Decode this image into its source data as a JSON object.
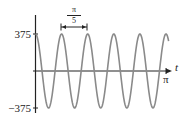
{
  "chart_data": {
    "type": "line",
    "title": "",
    "xlabel": "t",
    "ylabel": "",
    "function": "375*cos(10t)",
    "x_range": [
      0,
      3.14159
    ],
    "ylim": [
      -375,
      375
    ],
    "x_ticks": [
      {
        "value": 3.14159,
        "label": "π"
      }
    ],
    "y_ticks": [
      {
        "value": 375,
        "label": "375"
      },
      {
        "value": -375,
        "label": "−375"
      }
    ],
    "annotations": [
      {
        "type": "period-bracket",
        "label_num": "π",
        "label_den": "5",
        "label": "π/5",
        "from_x": 0.628,
        "to_x": 1.257
      }
    ],
    "period": "π/5",
    "amplitude": 375,
    "grid": false,
    "series": [
      {
        "name": "curve",
        "color": "#8a8a8a"
      }
    ]
  },
  "labels": {
    "y_top": "375",
    "y_bottom": "−375",
    "x_end": "π",
    "axis_t": "t",
    "period_num": "π",
    "period_den": "5"
  },
  "colors": {
    "curve": "#8a8a8a",
    "axis": "#222222"
  }
}
